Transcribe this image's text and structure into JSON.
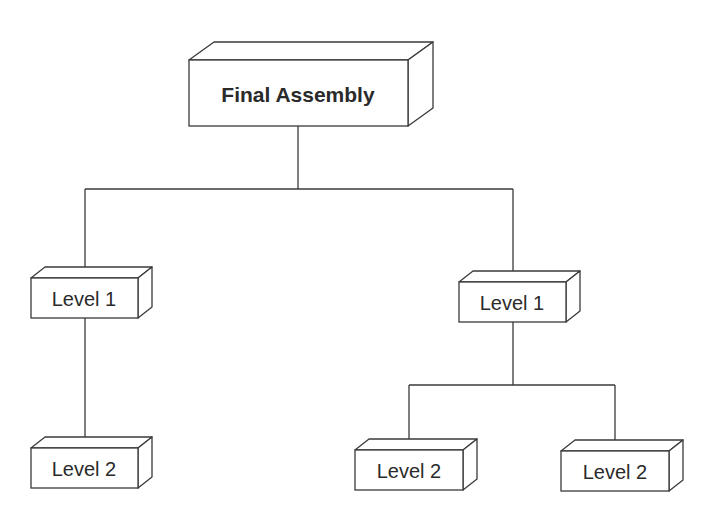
{
  "diagram": {
    "type": "hierarchy-tree",
    "root": {
      "label": "Final Assembly",
      "children": [
        {
          "label": "Level 1",
          "children": [
            {
              "label": "Level 2"
            }
          ]
        },
        {
          "label": "Level 1",
          "children": [
            {
              "label": "Level 2"
            },
            {
              "label": "Level 2"
            }
          ]
        }
      ]
    },
    "nodes": {
      "final_assembly": "Final Assembly",
      "level1_left": "Level 1",
      "level1_right": "Level 1",
      "level2_left": "Level 2",
      "level2_middle": "Level 2",
      "level2_right": "Level 2"
    }
  }
}
